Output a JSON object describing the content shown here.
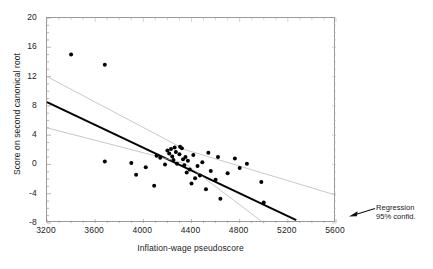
{
  "chart_data": {
    "type": "scatter",
    "title": "",
    "xlabel": "Inflation-wage pseudoscore",
    "ylabel": "Score on second canonical root",
    "xlim": [
      3200,
      5600
    ],
    "ylim": [
      -8,
      20
    ],
    "xticks": [
      3200,
      3600,
      4000,
      4400,
      4800,
      5200,
      5600
    ],
    "yticks": [
      -8,
      -4,
      0,
      4,
      8,
      12,
      16,
      20
    ],
    "grid": false,
    "legend_position": "right-outside",
    "annotations": [
      {
        "name": "regression-annotation",
        "lines": [
          "Regression",
          "95% confid."
        ],
        "arrow": "points-left-into-plot"
      }
    ],
    "series": [
      {
        "name": "observations",
        "marker": "filled-circle",
        "color": "#000000",
        "points": [
          [
            3400,
            15.0
          ],
          [
            3680,
            13.6
          ],
          [
            3680,
            0.4
          ],
          [
            3900,
            0.2
          ],
          [
            3940,
            -1.4
          ],
          [
            4020,
            -0.4
          ],
          [
            4090,
            -2.9
          ],
          [
            4110,
            1.2
          ],
          [
            4140,
            0.9
          ],
          [
            4180,
            0.0
          ],
          [
            4200,
            1.9
          ],
          [
            4215,
            1.5
          ],
          [
            4230,
            2.1
          ],
          [
            4240,
            1.1
          ],
          [
            4250,
            0.6
          ],
          [
            4260,
            2.3
          ],
          [
            4270,
            1.7
          ],
          [
            4280,
            0.1
          ],
          [
            4300,
            1.4
          ],
          [
            4305,
            2.4
          ],
          [
            4320,
            2.2
          ],
          [
            4330,
            0.7
          ],
          [
            4340,
            -0.1
          ],
          [
            4350,
            1.0
          ],
          [
            4360,
            -1.1
          ],
          [
            4370,
            0.5
          ],
          [
            4385,
            -0.7
          ],
          [
            4400,
            -2.6
          ],
          [
            4415,
            1.3
          ],
          [
            4430,
            -1.9
          ],
          [
            4450,
            -0.2
          ],
          [
            4470,
            -1.5
          ],
          [
            4490,
            0.3
          ],
          [
            4520,
            -3.4
          ],
          [
            4540,
            1.6
          ],
          [
            4560,
            -0.9
          ],
          [
            4600,
            -2.1
          ],
          [
            4620,
            1.0
          ],
          [
            4640,
            -4.7
          ],
          [
            4700,
            -1.2
          ],
          [
            4760,
            0.8
          ],
          [
            4800,
            -0.5
          ],
          [
            4860,
            0.1
          ],
          [
            4980,
            -2.4
          ],
          [
            5000,
            -5.2
          ]
        ]
      }
    ],
    "fit_lines": [
      {
        "name": "regression-line",
        "style": "solid-thick",
        "color": "#000000",
        "points": [
          [
            3200,
            8.5
          ],
          [
            5270,
            -7.6
          ]
        ]
      },
      {
        "name": "upper-confidence-band",
        "style": "solid-thin",
        "color": "#b0b0b0",
        "points": [
          [
            3200,
            12.0
          ],
          [
            4350,
            2.0
          ],
          [
            5600,
            -4.2
          ]
        ]
      },
      {
        "name": "lower-confidence-band",
        "style": "solid-thin",
        "color": "#b0b0b0",
        "points": [
          [
            3200,
            5.0
          ],
          [
            4350,
            0.1
          ],
          [
            5000,
            -8.0
          ]
        ]
      }
    ]
  },
  "axes": {
    "x_tick_labels": [
      "3200",
      "3600",
      "4000",
      "4400",
      "4800",
      "5200",
      "5600"
    ],
    "y_tick_labels": [
      "20",
      "16",
      "12",
      "8",
      "4",
      "0",
      "-4",
      "-8"
    ],
    "x_title": "Inflation-wage pseudoscore",
    "y_title": "Score on second canonical root"
  },
  "annotation": {
    "line1": "Regression",
    "line2": "95% confid."
  }
}
